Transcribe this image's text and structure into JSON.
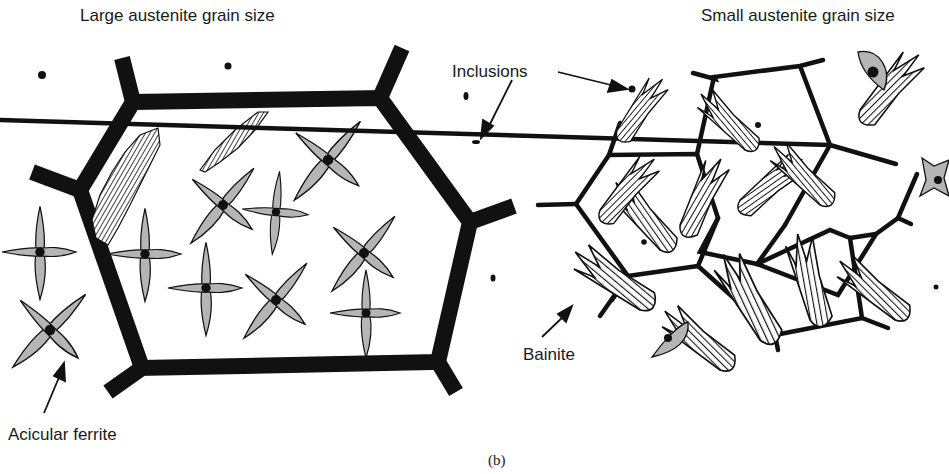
{
  "titles": {
    "left": "Large austenite grain size",
    "right": "Small austenite grain size"
  },
  "labels": {
    "inclusions": "Inclusions",
    "bainite": "Bainite",
    "acicular_ferrite": "Acicular ferrite"
  },
  "caption": "(b)",
  "colors": {
    "boundary": "#111111",
    "ferrite_fill": "#b5b5b5",
    "outline": "#111111",
    "background": "#ffffff"
  }
}
